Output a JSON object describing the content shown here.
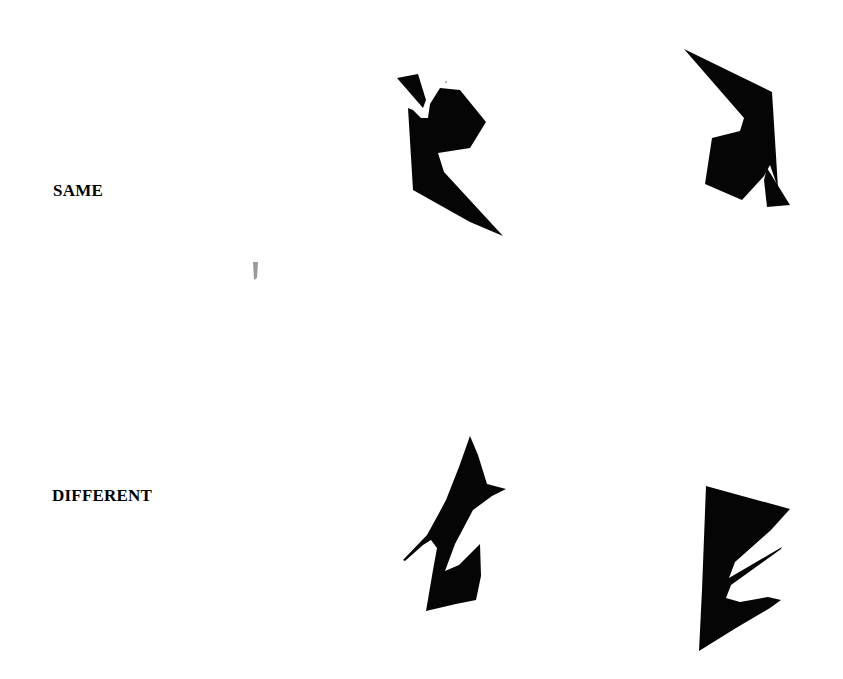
{
  "figure": {
    "rows": [
      {
        "label": "SAME",
        "left_figure": "rotated polygon A",
        "right_figure": "rotated polygon A (same, rotated 180°)"
      },
      {
        "label": "DIFFERENT",
        "left_figure": "polygon B",
        "right_figure": "polygon C (different)"
      }
    ],
    "colors": {
      "background": "#ffffff",
      "shape_fill": "#050505",
      "text": "#000000"
    }
  }
}
